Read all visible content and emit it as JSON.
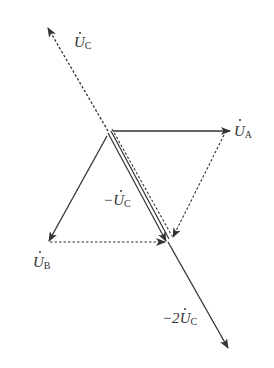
{
  "diagram": {
    "type": "phasor-diagram",
    "colors": {
      "stroke": "#333333",
      "background": "#ffffff"
    },
    "phasors": [
      {
        "id": "UA",
        "symbol": "U",
        "subscript": "A",
        "prefix": "",
        "style": "solid"
      },
      {
        "id": "UB",
        "symbol": "U",
        "subscript": "B",
        "prefix": "",
        "style": "solid"
      },
      {
        "id": "UC",
        "symbol": "U",
        "subscript": "C",
        "prefix": "",
        "style": "dashed"
      },
      {
        "id": "negUC",
        "symbol": "U",
        "subscript": "C",
        "prefix": "−",
        "style": "double"
      },
      {
        "id": "neg2UC",
        "symbol": "U",
        "subscript": "C",
        "prefix": "−2",
        "style": "solid"
      }
    ],
    "construction_lines": [
      {
        "from": "UA tip",
        "to": "−UC tip",
        "style": "dashed"
      },
      {
        "from": "UB tip",
        "to": "−UC tip",
        "style": "dashed"
      }
    ]
  }
}
